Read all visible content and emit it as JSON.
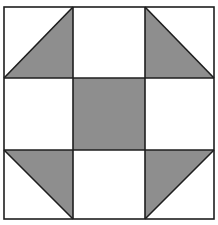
{
  "diagram": {
    "title": "",
    "type": "quilt-block",
    "pattern_name": "",
    "grid": {
      "rows": 3,
      "cols": 3
    },
    "colors": {
      "background": "#ffffff",
      "fill": "#8e8e8e",
      "line": "#1e1e1e"
    },
    "cells": [
      {
        "row": 0,
        "col": 0,
        "kind": "half-square-triangle",
        "shaded": "bottom-right",
        "diagonal": "bottom-left-to-top-right"
      },
      {
        "row": 0,
        "col": 1,
        "kind": "plain",
        "shaded": "none"
      },
      {
        "row": 0,
        "col": 2,
        "kind": "half-square-triangle",
        "shaded": "bottom-left",
        "diagonal": "top-left-to-bottom-right"
      },
      {
        "row": 1,
        "col": 0,
        "kind": "plain",
        "shaded": "none"
      },
      {
        "row": 1,
        "col": 1,
        "kind": "plain",
        "shaded": "full"
      },
      {
        "row": 1,
        "col": 2,
        "kind": "plain",
        "shaded": "none"
      },
      {
        "row": 2,
        "col": 0,
        "kind": "half-square-triangle",
        "shaded": "top-right",
        "diagonal": "top-left-to-bottom-right"
      },
      {
        "row": 2,
        "col": 1,
        "kind": "plain",
        "shaded": "none"
      },
      {
        "row": 2,
        "col": 2,
        "kind": "half-square-triangle",
        "shaded": "top-left",
        "diagonal": "bottom-left-to-top-right"
      }
    ]
  }
}
